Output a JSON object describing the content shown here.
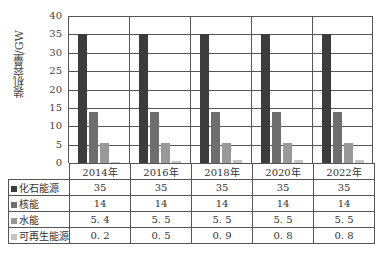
{
  "chart_data": {
    "type": "bar",
    "title": "",
    "xlabel": "",
    "ylabel": "装机容量/GW",
    "ylim": [
      0,
      40
    ],
    "yticks": [
      0,
      5,
      10,
      15,
      20,
      25,
      30,
      35,
      40
    ],
    "grid": true,
    "legend_position": "data-table-left",
    "categories": [
      "2014年",
      "2016年",
      "2018年",
      "2020年",
      "2022年"
    ],
    "series": [
      {
        "name": "化石能源",
        "color": "#3c3c3c",
        "values": [
          35,
          35,
          35,
          35,
          35
        ]
      },
      {
        "name": "核能",
        "color": "#6e6e6e",
        "values": [
          14,
          14,
          14,
          14,
          14
        ]
      },
      {
        "name": "水能",
        "color": "#999999",
        "values": [
          5.4,
          5.5,
          5.5,
          5.5,
          5.5
        ]
      },
      {
        "name": "可再生能源",
        "color": "#c4c4c4",
        "values": [
          0.2,
          0.5,
          0.9,
          0.8,
          0.8
        ]
      }
    ],
    "table": {
      "rows": [
        {
          "label": "化石能源",
          "cells": [
            "35",
            "35",
            "35",
            "35",
            "35"
          ]
        },
        {
          "label": "核能",
          "cells": [
            "14",
            "14",
            "14",
            "14",
            "14"
          ]
        },
        {
          "label": "水能",
          "cells": [
            "5. 4",
            "5. 5",
            "5. 5",
            "5. 5",
            "5. 5"
          ]
        },
        {
          "label": "可再生能源",
          "cells": [
            "0. 2",
            "0. 5",
            "0. 9",
            "0. 8",
            "0. 8"
          ]
        }
      ]
    }
  }
}
